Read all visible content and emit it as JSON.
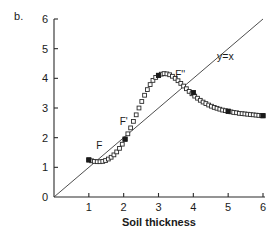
{
  "panel": {
    "label": "b."
  },
  "chart_data": {
    "type": "scatter",
    "title": "",
    "xlabel": "Soil thickness",
    "ylabel": "",
    "xlim": [
      0,
      6
    ],
    "ylim": [
      0,
      6
    ],
    "xticks": [
      0,
      1,
      2,
      3,
      4,
      5,
      6
    ],
    "yticks": [
      0,
      1,
      2,
      3,
      4,
      5,
      6
    ],
    "xticklabels": [
      "0",
      "1",
      "2",
      "3",
      "4",
      "5",
      "6"
    ],
    "yticklabels": [
      "0",
      "1",
      "2",
      "3",
      "4",
      "5",
      "6"
    ],
    "grid": false,
    "legend": "none",
    "series": [
      {
        "name": "F(x) map",
        "marker": "open-square",
        "x": [
          1.0,
          1.08,
          1.16,
          1.24,
          1.32,
          1.4,
          1.48,
          1.56,
          1.64,
          1.72,
          1.8,
          1.88,
          1.96,
          2.04,
          2.12,
          2.2,
          2.28,
          2.36,
          2.44,
          2.52,
          2.6,
          2.68,
          2.76,
          2.84,
          2.92,
          3.0,
          3.08,
          3.16,
          3.24,
          3.32,
          3.4,
          3.48,
          3.56,
          3.64,
          3.72,
          3.8,
          3.88,
          3.96,
          4.04,
          4.12,
          4.2,
          4.28,
          4.36,
          4.44,
          4.52,
          4.6,
          4.68,
          4.76,
          4.84,
          4.92,
          5.0,
          5.08,
          5.16,
          5.24,
          5.32,
          5.4,
          5.48,
          5.56,
          5.64,
          5.72,
          5.8,
          5.88,
          5.96,
          6.0
        ],
        "y": [
          1.25,
          1.22,
          1.2,
          1.19,
          1.19,
          1.2,
          1.23,
          1.28,
          1.34,
          1.42,
          1.52,
          1.64,
          1.78,
          1.95,
          2.13,
          2.33,
          2.55,
          2.77,
          3.0,
          3.22,
          3.43,
          3.62,
          3.79,
          3.93,
          4.03,
          4.1,
          4.14,
          4.16,
          4.15,
          4.12,
          4.07,
          4.0,
          3.92,
          3.83,
          3.74,
          3.65,
          3.56,
          3.48,
          3.4,
          3.33,
          3.26,
          3.2,
          3.15,
          3.1,
          3.06,
          3.02,
          2.99,
          2.96,
          2.93,
          2.91,
          2.89,
          2.87,
          2.85,
          2.84,
          2.82,
          2.81,
          2.8,
          2.79,
          2.78,
          2.77,
          2.76,
          2.75,
          2.74,
          2.74
        ]
      },
      {
        "name": "fixed-point markers",
        "marker": "filled-square",
        "x": [
          1.0,
          2.04,
          3.0,
          4.0,
          5.0,
          6.0
        ],
        "y": [
          1.25,
          1.95,
          4.1,
          3.52,
          2.89,
          2.74
        ]
      }
    ],
    "reference_line": {
      "name": "identity",
      "label": "y=x",
      "x": [
        0,
        6
      ],
      "y": [
        0,
        6
      ]
    },
    "annotations": [
      {
        "text": "F",
        "x": 1.3,
        "y": 1.62
      },
      {
        "text": "F'",
        "x": 2.0,
        "y": 2.42
      },
      {
        "text": "F''",
        "x": 3.62,
        "y": 4.02
      },
      {
        "text": "y=x",
        "x": 4.92,
        "y": 4.62
      }
    ]
  }
}
